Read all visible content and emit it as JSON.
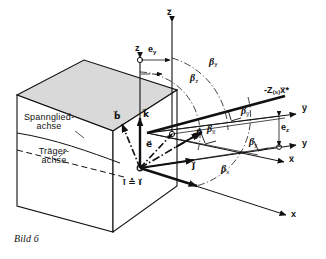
{
  "figure": {
    "caption": "Bild 6",
    "background_color": "#ffffff",
    "ink_color": "#111111",
    "block_fill": "#d9d9d9",
    "block_face_fill": "#ffffff"
  },
  "block_labels": {
    "tendon_axis_line1": "Spannglied-",
    "tendon_axis_line2": "achse",
    "girder_axis_line1": "Träger-",
    "girder_axis_line2": "achse"
  },
  "axes": [
    {
      "name": "axis-z",
      "label": "z",
      "bar": false
    },
    {
      "name": "axis-z-bar",
      "label": "z",
      "bar": true
    },
    {
      "name": "axis-y-bar",
      "label": "y",
      "bar": true
    },
    {
      "name": "axis-y",
      "label": "y",
      "bar": false
    },
    {
      "name": "axis-x-bar",
      "label": "x",
      "bar": true
    },
    {
      "name": "axis-x",
      "label": "x",
      "bar": false
    }
  ],
  "axis_labels": {
    "z": "z",
    "z_bar": "z̅",
    "y_bar": "y̅",
    "y": "y",
    "x_bar": "x̅",
    "x": "x"
  },
  "eccentricities": {
    "e_y": {
      "symbol": "e",
      "subscript": "y"
    },
    "e_z": {
      "symbol": "e",
      "subscript": "z"
    }
  },
  "vectors": [
    {
      "name": "vector-b",
      "symbol": "b",
      "style": "dash-dot"
    },
    {
      "name": "vector-k",
      "symbol": "k",
      "style": "solid"
    },
    {
      "name": "vector-e",
      "symbol": "e",
      "style": "dash-dot"
    },
    {
      "name": "vector-n",
      "symbol": "n",
      "style": "solid"
    },
    {
      "name": "vector-j",
      "symbol": "j",
      "style": "solid"
    },
    {
      "name": "vector-i",
      "symbol": "i",
      "style": "solid"
    }
  ],
  "vector_labels": {
    "b": "b⃗",
    "k": "k⃗",
    "e": "e⃗",
    "n": "n⃗",
    "j": "j⃗",
    "i_equiv": "ī ≙ i⃗"
  },
  "force_label": {
    "prefix": "-Z",
    "subscript": "(s)",
    "direction": "x̅*",
    "full": "-Z(s)x̅*"
  },
  "angles": [
    {
      "name": "angle-beta-z-bar",
      "symbol": "β",
      "subscript": "z̅"
    },
    {
      "name": "angle-beta-z",
      "symbol": "β",
      "subscript": "z"
    },
    {
      "name": "angle-beta-y-bar",
      "symbol": "β",
      "subscript": "y̅"
    },
    {
      "name": "angle-beta-x-bar",
      "symbol": "β",
      "subscript": "x̅"
    },
    {
      "name": "angle-beta-y",
      "symbol": "β",
      "subscript": "y"
    },
    {
      "name": "angle-beta-x",
      "symbol": "β",
      "subscript": "x"
    }
  ],
  "angle_labels": {
    "beta_z_bar": "β",
    "beta_z": "β",
    "beta_y_bar": "β",
    "beta_x_bar": "β",
    "beta_y": "β",
    "beta_x": "β",
    "sub_z_bar": "z̅",
    "sub_z": "z",
    "sub_y_bar": "y̅",
    "sub_x_bar": "x̅",
    "sub_y": "y",
    "sub_x": "x"
  }
}
